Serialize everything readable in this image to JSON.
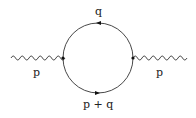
{
  "diagram": {
    "type": "feynman-diagram",
    "colors": {
      "line": "#333333",
      "background": "#ffffff"
    },
    "labels": {
      "loop_top": "q",
      "loop_bottom": "p + q",
      "external_left": "p",
      "external_right": "p"
    },
    "elements": {
      "external_left": "wavy-line",
      "external_right": "wavy-line",
      "loop": "circle-fermion-loop",
      "vertex_left": "vertex-dot",
      "vertex_right": "vertex-dot",
      "arrow_top": "arrow-left",
      "arrow_bottom": "arrow-left"
    }
  }
}
